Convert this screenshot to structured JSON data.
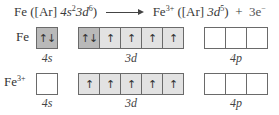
{
  "equation": {
    "reactant": "Fe",
    "reactant_config_open": "([Ar] ",
    "reactant_4s": "4s",
    "reactant_4s_sup": "2",
    "reactant_3d": "3d",
    "reactant_3d_sup": "6",
    "reactant_config_close": ")",
    "arrow": "reaction-arrow",
    "product": "Fe",
    "product_charge": "3+",
    "product_config_open": "([Ar] ",
    "product_3d": "3d",
    "product_3d_sup": "5",
    "product_config_close": ")",
    "plus": "+",
    "electrons": "3e",
    "electron_charge": "−"
  },
  "rows": [
    {
      "label": "Fe",
      "label_charge": "",
      "orbitals": {
        "4s": [
          "↑↓"
        ],
        "3d": [
          "↑↓",
          "↑",
          "↑",
          "↑",
          "↑"
        ],
        "4p": [
          "",
          "",
          ""
        ]
      }
    },
    {
      "label": "Fe",
      "label_charge": "3+",
      "orbitals": {
        "4s": [
          ""
        ],
        "3d": [
          "↑",
          "↑",
          "↑",
          "↑",
          "↑"
        ],
        "4p": [
          "",
          "",
          ""
        ]
      }
    }
  ],
  "sublabels": {
    "s": "4s",
    "d": "3d",
    "p": "4p"
  },
  "colors": {
    "filled_dark": "#b9b9b9",
    "filled_light": "#e2e2e2",
    "empty": "#ffffff",
    "border": "#6a6a6a"
  }
}
